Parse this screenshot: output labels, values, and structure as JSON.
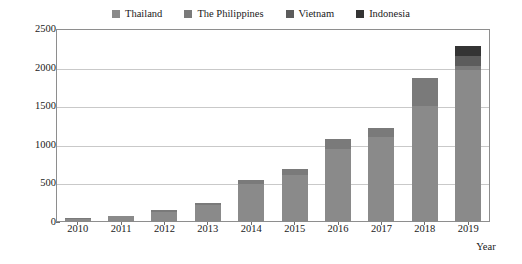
{
  "chart_data": {
    "type": "bar",
    "subtype": "stacked",
    "title": "",
    "xlabel": "Year",
    "ylabel": "Wind power installed capacity/MW",
    "categories": [
      "2010",
      "2011",
      "2012",
      "2013",
      "2014",
      "2015",
      "2016",
      "2017",
      "2018",
      "2019"
    ],
    "ylim": [
      0,
      2500
    ],
    "yticks": [
      0,
      500,
      1000,
      1500,
      2000,
      2500
    ],
    "grid": true,
    "legend_position": "top-center",
    "series": [
      {
        "name": "Thailand",
        "color": "#8a8a8a",
        "values": [
          45,
          75,
          135,
          222,
          498,
          615,
          950,
          1100,
          1500,
          1970
        ]
      },
      {
        "name": "The Philippines",
        "color": "#7a7a7a",
        "values": [
          3,
          5,
          20,
          24,
          46,
          71,
          125,
          118,
          365,
          55
        ]
      },
      {
        "name": "Vietnam",
        "color": "#5c5c5c",
        "values": [
          0,
          0,
          0,
          0,
          0,
          0,
          0,
          0,
          0,
          120
        ]
      },
      {
        "name": "Indonesia",
        "color": "#343434",
        "values": [
          0,
          0,
          0,
          0,
          0,
          0,
          0,
          0,
          0,
          135
        ]
      }
    ],
    "totals": [
      48,
      80,
      155,
      246,
      544,
      686,
      1075,
      1218,
      1865,
      2280
    ]
  },
  "legend": {
    "items": [
      {
        "label": "Thailand",
        "color": "#8a8a8a"
      },
      {
        "label": "The Philippines",
        "color": "#7a7a7a"
      },
      {
        "label": "Vietnam",
        "color": "#5c5c5c"
      },
      {
        "label": "Indonesia",
        "color": "#343434"
      }
    ]
  },
  "axes": {
    "y_title": "Wind power installed capacity/MW",
    "x_title": "Year",
    "y_ticks": [
      "0",
      "500",
      "1000",
      "1500",
      "2000",
      "2500"
    ],
    "x_ticks": [
      "2010",
      "2011",
      "2012",
      "2013",
      "2014",
      "2015",
      "2016",
      "2017",
      "2018",
      "2019"
    ]
  },
  "style": {
    "frame_color": "#8e8e8e",
    "grid_color": "#c9c9c9",
    "background": "#ffffff",
    "text_color": "#1a1a1a"
  }
}
